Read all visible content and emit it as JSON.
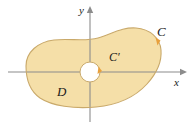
{
  "figure": {
    "type": "math-region-diagram",
    "background_color": "#ffffff",
    "region": {
      "fill_color": "#f5dfa8",
      "stroke_color": "#c9a96a",
      "label": "D"
    },
    "outer_curve": {
      "label": "C",
      "orientation_marker": "arrowhead",
      "marker_color": "#e8a03c"
    },
    "inner_curve": {
      "label": "C'",
      "hole_fill": "#ffffff",
      "orientation_marker": "arrowhead",
      "marker_color": "#e8a03c"
    },
    "axes": {
      "color": "#8c8c8c",
      "x_label": "x",
      "y_label": "y",
      "origin": {
        "x": 90,
        "y": 72
      }
    },
    "labels": {
      "outer_curve": "C",
      "inner_curve": "C′",
      "region": "D",
      "x_axis": "x",
      "y_axis": "y"
    }
  }
}
